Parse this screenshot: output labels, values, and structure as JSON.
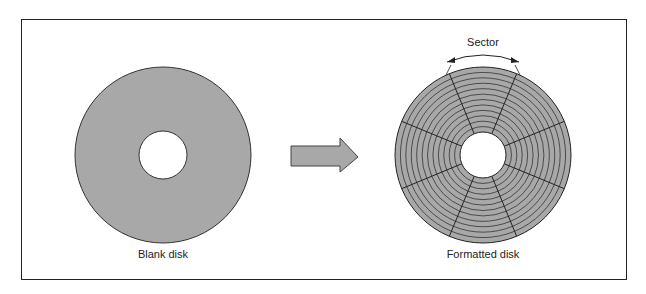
{
  "diagram": {
    "left_label": "Blank disk",
    "right_label": "Formatted disk",
    "sector_label": "Sector",
    "disk_fill": "#a8a8a8",
    "line_color": "#222222",
    "tracks": 12,
    "sectors": 8
  }
}
